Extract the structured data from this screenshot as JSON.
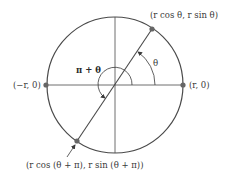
{
  "diagram": {
    "type": "polar-point-symmetry",
    "colors": {
      "stroke": "#4a4a4a",
      "point": "#666666",
      "text": "#3a3a3a"
    },
    "circle": {
      "cx": 115,
      "cy": 85,
      "r": 68
    },
    "labels": {
      "point_theta": "(r cos θ, r sin θ)",
      "point_theta_pi": "(r cos (θ + π), r sin (θ + π))",
      "point_left": "(−r, 0)",
      "point_right": "(r, 0)",
      "angle_theta": "θ",
      "angle_pi_theta": "π + θ"
    }
  }
}
